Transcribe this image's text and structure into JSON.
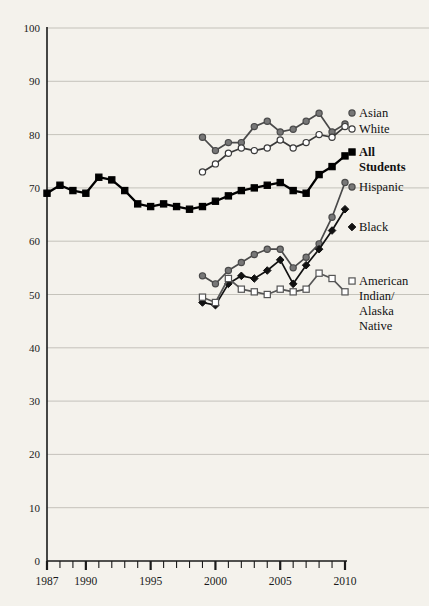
{
  "chart_data": {
    "type": "line",
    "title": "",
    "subtitle": "",
    "xlabel": "",
    "ylabel": "",
    "xlim": [
      1987,
      2010
    ],
    "ylim": [
      0,
      100
    ],
    "grid": true,
    "legend_position": "right-inline",
    "x_tick_labels": [
      "1987",
      "1990",
      "1995",
      "2000",
      "2005",
      "2010"
    ],
    "x_tick_values": [
      1987,
      1990,
      1995,
      2000,
      2005,
      2010
    ],
    "y_tick_labels": [
      "0",
      "10",
      "20",
      "30",
      "40",
      "50",
      "60",
      "70",
      "80",
      "90",
      "100"
    ],
    "y_tick_values": [
      0,
      10,
      20,
      30,
      40,
      50,
      60,
      70,
      80,
      90,
      100
    ],
    "series": [
      {
        "name": "Asian",
        "label": "Asian",
        "color": "#4a4a4a",
        "marker": "filled-circle",
        "marker_fill": "#777777",
        "bold": false,
        "x": [
          1999,
          2000,
          2001,
          2002,
          2003,
          2004,
          2005,
          2006,
          2007,
          2008,
          2009,
          2010
        ],
        "values": [
          79.5,
          77.0,
          78.5,
          78.5,
          81.5,
          82.5,
          80.5,
          81.0,
          82.5,
          84.0,
          80.5,
          82.0
        ]
      },
      {
        "name": "White",
        "label": "White",
        "color": "#3a3a3a",
        "marker": "open-circle",
        "marker_fill": "#ffffff",
        "bold": false,
        "x": [
          1999,
          2000,
          2001,
          2002,
          2003,
          2004,
          2005,
          2006,
          2007,
          2008,
          2009,
          2010
        ],
        "values": [
          73.0,
          74.5,
          76.5,
          77.5,
          77.0,
          77.5,
          79.0,
          77.5,
          78.5,
          80.0,
          79.5,
          81.5
        ]
      },
      {
        "name": "All Students",
        "label": "All\nStudents",
        "color": "#000000",
        "marker": "filled-square",
        "marker_fill": "#000000",
        "bold": true,
        "x": [
          1987,
          1988,
          1989,
          1990,
          1991,
          1992,
          1993,
          1994,
          1995,
          1996,
          1997,
          1998,
          1999,
          2000,
          2001,
          2002,
          2003,
          2004,
          2005,
          2006,
          2007,
          2008,
          2009,
          2010
        ],
        "values": [
          69.0,
          70.5,
          69.5,
          69.0,
          72.0,
          71.5,
          69.5,
          67.0,
          66.5,
          67.0,
          66.5,
          66.0,
          66.5,
          67.5,
          68.5,
          69.5,
          70.0,
          70.5,
          71.0,
          69.5,
          69.0,
          72.5,
          74.0,
          76.0
        ]
      },
      {
        "name": "Hispanic",
        "label": "Hispanic",
        "color": "#4a4a4a",
        "marker": "filled-circle",
        "marker_fill": "#777777",
        "bold": false,
        "x": [
          1999,
          2000,
          2001,
          2002,
          2003,
          2004,
          2005,
          2006,
          2007,
          2008,
          2009,
          2010
        ],
        "values": [
          53.5,
          52.0,
          54.5,
          56.0,
          57.5,
          58.5,
          58.5,
          55.0,
          57.0,
          59.5,
          64.5,
          71.0
        ]
      },
      {
        "name": "Black",
        "label": "Black",
        "color": "#111111",
        "marker": "filled-diamond",
        "marker_fill": "#111111",
        "bold": false,
        "x": [
          1999,
          2000,
          2001,
          2002,
          2003,
          2004,
          2005,
          2006,
          2007,
          2008,
          2009,
          2010
        ],
        "values": [
          48.5,
          48.0,
          52.0,
          53.5,
          53.0,
          54.5,
          56.5,
          52.0,
          55.5,
          58.5,
          62.0,
          66.0
        ]
      },
      {
        "name": "American Indian/Alaska Native",
        "label": "American\nIndian/\nAlaska\nNative",
        "color": "#555555",
        "marker": "open-square",
        "marker_fill": "#ffffff",
        "bold": false,
        "x": [
          1999,
          2000,
          2001,
          2002,
          2003,
          2004,
          2005,
          2006,
          2007,
          2008,
          2009,
          2010
        ],
        "values": [
          49.5,
          48.5,
          53.0,
          51.0,
          50.5,
          50.0,
          51.0,
          50.5,
          51.0,
          54.0,
          53.0,
          50.5
        ]
      }
    ],
    "legend_entries": [
      {
        "label": "Asian",
        "lines": [
          "Asian"
        ],
        "bold": false
      },
      {
        "label": "White",
        "lines": [
          "White"
        ],
        "bold": false
      },
      {
        "label": "All Students",
        "lines": [
          "All",
          "Students"
        ],
        "bold": true
      },
      {
        "label": "Hispanic",
        "lines": [
          "Hispanic"
        ],
        "bold": false
      },
      {
        "label": "Black",
        "lines": [
          "Black"
        ],
        "bold": false
      },
      {
        "label": "American Indian/Alaska Native",
        "lines": [
          "American",
          "Indian/",
          "Alaska",
          "Native"
        ],
        "bold": false
      }
    ]
  },
  "colors": {
    "background": "#f4f2ec",
    "axis": "#1a1a1a",
    "gridline": "#b9b6ae",
    "text": "#111111"
  }
}
